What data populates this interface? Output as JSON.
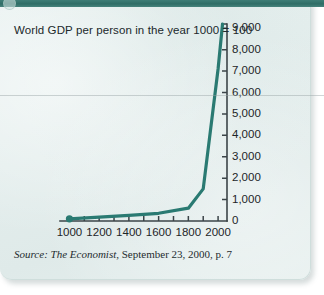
{
  "figure": {
    "title": "World GDP per person in the year 1000 = 100",
    "source_label": "Source: The Economist,",
    "source_rest": " September 23, 2000, p. 7",
    "accent_color": "#2a7a72",
    "axis_color": "#3b4448",
    "paper_color": "#e5efed",
    "band_color": "#2f6d66"
  },
  "chart_data": {
    "type": "line",
    "title": "World GDP per person in the year 1000 = 100",
    "xlabel": "",
    "ylabel": "",
    "xlim": [
      950,
      2060
    ],
    "ylim": [
      0,
      9200
    ],
    "grid": false,
    "legend": "none",
    "y_axis_position": "right",
    "y_ticks": [
      0,
      1000,
      2000,
      3000,
      4000,
      5000,
      6000,
      7000,
      8000,
      9000
    ],
    "y_tick_labels": [
      "0",
      "1,000",
      "2,000",
      "3,000",
      "4,000",
      "5,000",
      "6,000",
      "7,000",
      "8,000",
      "9,000"
    ],
    "x_ticks": [
      1000,
      1200,
      1400,
      1600,
      1800,
      2000
    ],
    "x_tick_labels": [
      "1000",
      "1200",
      "1400",
      "1600",
      "1800",
      "2000"
    ],
    "x_minor_ticks": [
      1100,
      1300,
      1500,
      1700,
      1900,
      2100
    ],
    "series": [
      {
        "name": "World GDP per person (index, 1000 = 100)",
        "color": "#2a7a72",
        "marker_at_start": true,
        "x": [
          1000,
          1200,
          1400,
          1600,
          1800,
          1900,
          2000,
          2030
        ],
        "y": [
          100,
          180,
          260,
          360,
          600,
          1500,
          7100,
          9200
        ]
      }
    ]
  }
}
